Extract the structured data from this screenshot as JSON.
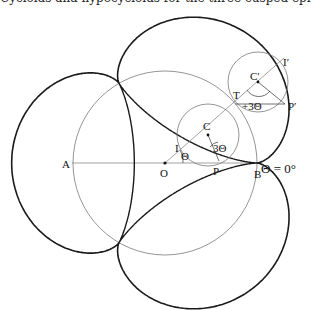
{
  "caption": "Cycloids and hypocycloids for the three-cusped epicycloid.",
  "diagram": {
    "type": "three-cusped epicycloid with rolling circles",
    "labels": {
      "A": "A",
      "O": "O",
      "B": "B",
      "P": "P",
      "I": "I",
      "C": "C",
      "T": "T",
      "C_prime": "C′",
      "I_prime": "I′",
      "P_prime": "P′",
      "theta": "Θ",
      "three_theta": "3Θ",
      "plus_three_theta": "+3Θ",
      "theta_zero": "Θ = 0°"
    },
    "colors": {
      "curve": "#1a1a1a",
      "circle": "#7a7a7a",
      "background": "#ffffff"
    }
  }
}
